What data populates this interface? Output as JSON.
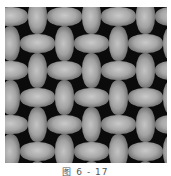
{
  "figure": {
    "type": "woven-fabric-texture",
    "colors": {
      "background": "#0b0b0b",
      "yarn_highlight": "#c9c9c9",
      "yarn_mid": "#a8a8a8",
      "page": "#ffffff"
    },
    "grid": {
      "cell_size_px": 27,
      "columns": 6,
      "rows": 6
    },
    "caption": "图 6 - 17"
  }
}
